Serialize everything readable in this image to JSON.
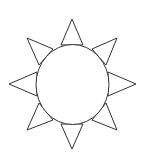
{
  "icon": {
    "name": "sun-icon",
    "stroke_color": "#333333",
    "fill_color": "#ffffff",
    "background": "#ffffff"
  }
}
